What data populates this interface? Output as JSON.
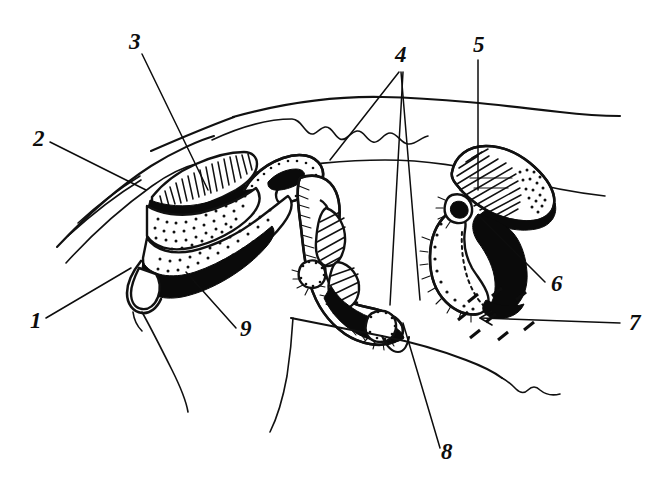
{
  "figure": {
    "kind": "anatomical-line-drawing",
    "title": "",
    "background_color": "#ffffff",
    "ink_color": "#111111",
    "width": 665,
    "height": 491
  },
  "labels": [
    {
      "id": "label-1",
      "text": "1",
      "x": 30,
      "y": 328,
      "leader_from": [
        46,
        318
      ],
      "leader_to": [
        131,
        268
      ]
    },
    {
      "id": "label-2",
      "text": "2",
      "x": 33,
      "y": 146,
      "leader_from": [
        50,
        142
      ],
      "leader_to": [
        146,
        190
      ]
    },
    {
      "id": "label-3",
      "text": "3",
      "x": 129,
      "y": 49,
      "leader_from": [
        142,
        54
      ],
      "leader_to": [
        208,
        190
      ]
    },
    {
      "id": "label-4",
      "text": "4",
      "x": 395,
      "y": 62,
      "leader_from": [
        399,
        72
      ],
      "leader_to": [
        330,
        160
      ]
    },
    {
      "id": "label-5",
      "text": "5",
      "x": 473,
      "y": 52,
      "leader_from": [
        478,
        60
      ],
      "leader_to": [
        478,
        190
      ]
    },
    {
      "id": "label-6",
      "text": "6",
      "x": 551,
      "y": 291,
      "leader_from": [
        545,
        282
      ],
      "leader_to": [
        478,
        215
      ]
    },
    {
      "id": "label-7",
      "text": "7",
      "x": 629,
      "y": 330,
      "leader_from": [
        620,
        323
      ],
      "leader_to": [
        480,
        318
      ]
    },
    {
      "id": "label-8",
      "text": "8",
      "x": 441,
      "y": 459,
      "leader_from": [
        440,
        448
      ],
      "leader_to": [
        403,
        323
      ]
    },
    {
      "id": "label-9",
      "text": "9",
      "x": 240,
      "y": 336,
      "leader_from": [
        236,
        328
      ],
      "leader_to": [
        186,
        272
      ]
    }
  ],
  "leader_extra": {
    "label4_second_line": {
      "from": [
        401,
        72
      ],
      "to": [
        420,
        300
      ]
    },
    "label4_third_line": {
      "from": [
        403,
        72
      ],
      "to": [
        390,
        305
      ]
    },
    "label7_arrowhead": [
      [
        480,
        318
      ],
      [
        492,
        311
      ],
      [
        492,
        325
      ]
    ]
  },
  "structures": [
    {
      "name": "outer-body-contour",
      "kind": "contour"
    },
    {
      "name": "wavy-surface-line",
      "kind": "contour"
    },
    {
      "name": "upper-hatched-ridge",
      "kind": "hatched-mass"
    },
    {
      "name": "stippled-mass-upper",
      "kind": "stippled-mass"
    },
    {
      "name": "stippled-mass-lower",
      "kind": "stippled-mass"
    },
    {
      "name": "central-lobed-canal",
      "kind": "hatched-tube"
    },
    {
      "name": "bean-shaped-organ",
      "kind": "hatched-mass"
    },
    {
      "name": "black-filled-cavity",
      "kind": "solid-black"
    },
    {
      "name": "dashed-region",
      "kind": "dashed-strokes"
    },
    {
      "name": "lower-jaw-contour",
      "kind": "contour"
    }
  ]
}
